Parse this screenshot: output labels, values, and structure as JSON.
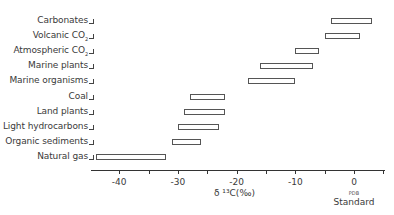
{
  "chart_data": {
    "type": "bar",
    "subtype": "floating-range-horizontal",
    "title": "",
    "xlabel": "δ13C (‰)",
    "ylabel": "",
    "xlim": [
      -45,
      5
    ],
    "x_ticks": [
      -40,
      -35,
      -30,
      -25,
      -20,
      -15,
      -10,
      -5,
      0,
      5
    ],
    "x_tick_labels": [
      "-40",
      "-30",
      "-20",
      "-10",
      "0"
    ],
    "x_tick_label_values": [
      -40,
      -30,
      -20,
      -10,
      0
    ],
    "zero_annotation": [
      "PDB",
      "Standard"
    ],
    "grid": false,
    "legend": null,
    "categories": [
      "Carbonates",
      "Volcanic CO2",
      "Atmospheric CO2",
      "Marine plants",
      "Marine organisms",
      "Coal",
      "Land plants",
      "Light hydrocarbons",
      "Organic sediments",
      "Natural gas"
    ],
    "ranges": [
      {
        "label": "Carbonates",
        "min": -4,
        "max": 3
      },
      {
        "label": "Volcanic CO2",
        "min": -5,
        "max": 1
      },
      {
        "label": "Atmospheric CO2",
        "min": -10,
        "max": -6
      },
      {
        "label": "Marine plants",
        "min": -16,
        "max": -7
      },
      {
        "label": "Marine organisms",
        "min": -18,
        "max": -10
      },
      {
        "label": "Coal",
        "min": -28,
        "max": -22
      },
      {
        "label": "Land plants",
        "min": -29,
        "max": -22
      },
      {
        "label": "Light hydrocarbons",
        "min": -30,
        "max": -23
      },
      {
        "label": "Organic sediments",
        "min": -31,
        "max": -26
      },
      {
        "label": "Natural gas",
        "min": -44,
        "max": -32
      }
    ]
  },
  "labels": {
    "rows": [
      {
        "main": "Carbonates",
        "sub": ""
      },
      {
        "main": "Volcanic CO",
        "sub": "2"
      },
      {
        "main": "Atmospheric CO",
        "sub": "2"
      },
      {
        "main": "Marine plants",
        "sub": ""
      },
      {
        "main": "Marine organisms",
        "sub": ""
      },
      {
        "main": "Coal",
        "sub": ""
      },
      {
        "main": "Land plants",
        "sub": ""
      },
      {
        "main": "Light hydrocarbons",
        "sub": ""
      },
      {
        "main": "Organic sediments",
        "sub": ""
      },
      {
        "main": "Natural gas",
        "sub": ""
      }
    ],
    "xlabel": "δ ¹³C(‰)",
    "pdb": "PDB",
    "standard": "Standard"
  }
}
